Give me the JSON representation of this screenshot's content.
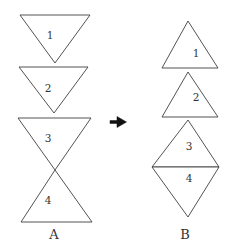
{
  "figure": {
    "background_color": "#ffffff",
    "stroke_color": "#3f3f3f",
    "text_color": "#333333",
    "arrow_color": "#111111",
    "canvas": {
      "width": 231,
      "height": 250
    },
    "arrow": {
      "icon": "right-arrow-icon",
      "points": "110,120.5 117,120.5 117,116.5 126.5,122 117,127.5 117,123.5 110,123.5"
    },
    "groups": [
      {
        "caption": "A",
        "caption_pos": {
          "x": 54,
          "y": 234
        },
        "shapes": [
          {
            "label": "1",
            "kind": "triangle-down",
            "points": "20,15 90,15 55,63",
            "label_pos": {
              "x": 50,
              "y": 35
            }
          },
          {
            "label": "2",
            "kind": "triangle-down",
            "points": "19,67 88,67 54,113",
            "label_pos": {
              "x": 48,
              "y": 88
            }
          },
          {
            "label": "3",
            "kind": "triangle-down",
            "points": "18,118 91,118 55,170",
            "label_pos": {
              "x": 48,
              "y": 138
            }
          },
          {
            "label": "4",
            "kind": "triangle-up",
            "points": "55,170 21,222 92,222",
            "label_pos": {
              "x": 48,
              "y": 200
            }
          }
        ]
      },
      {
        "caption": "B",
        "caption_pos": {
          "x": 185,
          "y": 234
        },
        "shapes": [
          {
            "label": "1",
            "kind": "triangle-up",
            "points": "188,21 162,68 218,68",
            "label_pos": {
              "x": 196,
              "y": 53
            }
          },
          {
            "label": "2",
            "kind": "triangle-up",
            "points": "188,72 162,117 218,117",
            "label_pos": {
              "x": 196,
              "y": 97
            }
          },
          {
            "label": "3",
            "kind": "triangle-up",
            "points": "188,120 152,167 219,167",
            "label_pos": {
              "x": 189,
              "y": 146
            }
          },
          {
            "label": "4",
            "kind": "triangle-down",
            "points": "152,167 219,167 188,217",
            "label_pos": {
              "x": 189,
              "y": 178
            }
          }
        ]
      }
    ]
  }
}
